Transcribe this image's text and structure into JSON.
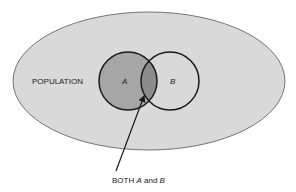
{
  "diagram": {
    "type": "venn",
    "population_label": "POPULATION",
    "set_a_label": "A",
    "set_b_label": "B",
    "annotation": {
      "prefix": "BOTH ",
      "a": "A",
      "middle": " and ",
      "b": "B"
    },
    "colors": {
      "population_fill": "#d9d9d9",
      "set_a_fill": "#a6a6a6",
      "intersection_fill": "#8c8c8c",
      "set_b_fill": "#e0e0e0",
      "outline": "#1a1a1a"
    }
  }
}
